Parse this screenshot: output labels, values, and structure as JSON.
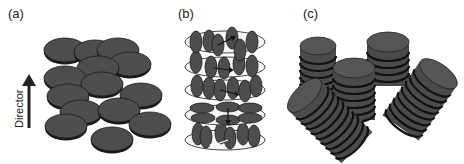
{
  "figure": {
    "panels": [
      {
        "id": "a",
        "label": "(a)",
        "description": "Nematic discotic phase: discs with normals aligned along director, positions disordered"
      },
      {
        "id": "b",
        "label": "(b)",
        "description": "Chiral nematic discotic phase: layers of discs with rotating director (arrows)"
      },
      {
        "id": "c",
        "label": "(c)",
        "description": "Columnar nematic phase: short columns of stacked discs"
      }
    ],
    "director_label": "Director",
    "colors": {
      "disc_fill": "#4a4a4a",
      "disc_edge": "#1a1a1a",
      "layer_fill": "#f4f4f4",
      "layer_edge": "#333333"
    }
  }
}
